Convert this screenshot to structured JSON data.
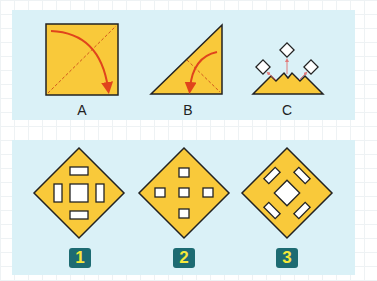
{
  "colors": {
    "paper": "#f9c93a",
    "outline": "#222222",
    "fold_arrow": "#e0441c",
    "fold_line": "#d0561e",
    "panel_bg": "#daf1f7",
    "badge_bg": "#1d6b72",
    "badge_text": "#f6e83a",
    "cut_arrow": "#e07a7a"
  },
  "steps": [
    {
      "label": "A",
      "description": "Square paper folded diagonally"
    },
    {
      "label": "B",
      "description": "Triangle folded in half"
    },
    {
      "label": "C",
      "description": "Folded triangle with three square cut-outs removed"
    }
  ],
  "options": [
    {
      "label": "1",
      "description": "Diamond with center square and four rectangles (top, bottom, left, right)"
    },
    {
      "label": "2",
      "description": "Diamond with five small squares in a plus pattern"
    },
    {
      "label": "3",
      "description": "Diamond with rotated center square and four diagonal rectangles"
    }
  ]
}
